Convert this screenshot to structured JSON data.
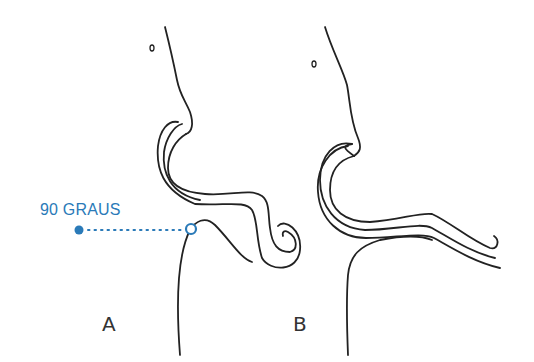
{
  "diagram": {
    "panels": [
      {
        "id": "A",
        "label": "A"
      },
      {
        "id": "B",
        "label": "B"
      }
    ],
    "annotation": {
      "text": "90 GRAUS",
      "color": "#2a7ab8"
    },
    "colors": {
      "stroke": "#222222",
      "background": "#ffffff"
    }
  }
}
